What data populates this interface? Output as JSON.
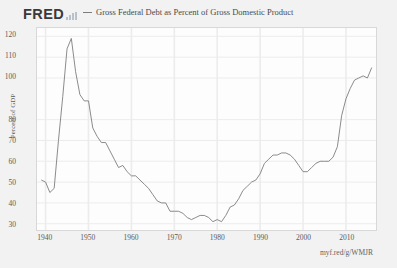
{
  "header": {
    "logo_text": "FRED",
    "logo_icon": "bar-chart-icon",
    "legend_swatch_color": "#7d7d7d",
    "series_label": "Gross Federal Debt as Percent of Gross Domestic Product"
  },
  "footer": {
    "source_note": "myf.red/g/WMJR"
  },
  "style": {
    "page_background": "#f2f2f2",
    "plot_background": "#fdfdfd",
    "line_color": "#7d7d7d",
    "grid_color": "#ececec",
    "axis_text_color": "#5a5a5a"
  },
  "chart_data": {
    "type": "line",
    "title": "Gross Federal Debt as Percent of Gross Domestic Product",
    "xlabel": "",
    "ylabel": "Percent of GDP",
    "xlim": [
      1938,
      2017
    ],
    "ylim": [
      27,
      124
    ],
    "yticks": [
      30,
      40,
      50,
      60,
      70,
      80,
      100,
      110,
      120
    ],
    "xticks": [
      1940,
      1950,
      1960,
      1970,
      1980,
      1990,
      2000,
      2010
    ],
    "grid": true,
    "legend_position": "top",
    "series": [
      {
        "name": "Gross Federal Debt as Percent of Gross Domestic Product",
        "color": "#7d7d7d",
        "x": [
          1939,
          1940,
          1941,
          1942,
          1943,
          1944,
          1945,
          1946,
          1947,
          1948,
          1949,
          1950,
          1951,
          1952,
          1953,
          1954,
          1955,
          1956,
          1957,
          1958,
          1959,
          1960,
          1961,
          1962,
          1963,
          1964,
          1965,
          1966,
          1967,
          1968,
          1969,
          1970,
          1971,
          1972,
          1973,
          1974,
          1975,
          1976,
          1977,
          1978,
          1979,
          1980,
          1981,
          1982,
          1983,
          1984,
          1985,
          1986,
          1987,
          1988,
          1989,
          1990,
          1991,
          1992,
          1993,
          1994,
          1995,
          1996,
          1997,
          1998,
          1999,
          2000,
          2001,
          2002,
          2003,
          2004,
          2005,
          2006,
          2007,
          2008,
          2009,
          2010,
          2011,
          2012,
          2013,
          2014,
          2015,
          2016
        ],
        "y": [
          51.0,
          50.0,
          45.0,
          47.0,
          70.0,
          91.0,
          114.0,
          119.0,
          103.0,
          92.0,
          89.0,
          89.0,
          76.0,
          72.0,
          69.0,
          69.0,
          65.0,
          61.0,
          57.0,
          58.0,
          55.0,
          53.0,
          53.0,
          51.0,
          49.0,
          47.0,
          44.0,
          41.0,
          40.0,
          40.0,
          36.0,
          36.0,
          36.0,
          35.0,
          33.0,
          32.0,
          33.0,
          34.0,
          34.0,
          33.0,
          31.0,
          32.0,
          31.0,
          34.0,
          38.0,
          39.0,
          42.0,
          46.0,
          48.0,
          50.0,
          51.0,
          54.0,
          59.0,
          61.0,
          63.0,
          63.0,
          64.0,
          64.0,
          63.0,
          61.0,
          58.0,
          55.0,
          55.0,
          57.0,
          59.0,
          60.0,
          60.0,
          60.0,
          62.0,
          67.0,
          82.0,
          90.0,
          95.0,
          99.0,
          100.0,
          101.0,
          100.0,
          105.0
        ]
      }
    ]
  }
}
